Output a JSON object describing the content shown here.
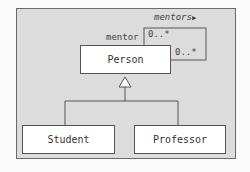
{
  "diagram": {
    "type": "UML class diagram",
    "classes": [
      {
        "name": "Person"
      },
      {
        "name": "Student"
      },
      {
        "name": "Professor"
      }
    ],
    "association": {
      "name": "mentors",
      "direction_marker": "▶",
      "role": "mentor",
      "multiplicity_1": "0..*",
      "multiplicity_2": "0..*"
    },
    "generalization": {
      "parent": "Person",
      "children": [
        "Student",
        "Professor"
      ]
    }
  }
}
